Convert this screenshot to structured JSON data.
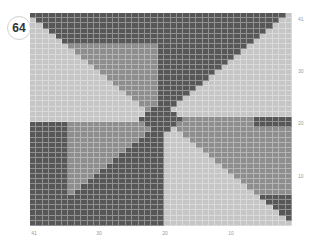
{
  "badge": {
    "number": "64"
  },
  "chart": {
    "columns": 41,
    "rows": 41,
    "colors": {
      "L": "#c6c6c6",
      "M": "#8e8e8e",
      "D": "#575757"
    },
    "row_labels": [
      {
        "label": "41",
        "y": 16
      },
      {
        "label": "30",
        "y": 68
      },
      {
        "label": "20",
        "y": 120
      },
      {
        "label": "10",
        "y": 173
      }
    ],
    "col_labels": [
      {
        "label": "41",
        "x": 34
      },
      {
        "label": "30",
        "x": 99
      },
      {
        "label": "20",
        "x": 165
      },
      {
        "label": "10",
        "x": 231
      }
    ]
  }
}
